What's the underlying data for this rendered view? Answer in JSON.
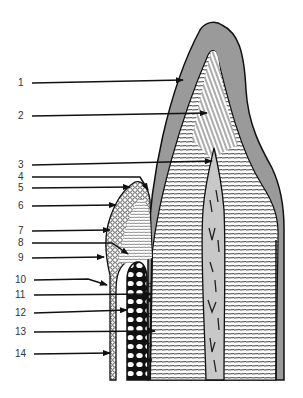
{
  "diagram": {
    "colors": {
      "enamel": "#9a9a9a",
      "pulp": "#c8c8c8",
      "outline": "#111111",
      "background": "#ffffff",
      "label_text": "#333333"
    },
    "labels": [
      {
        "id": "1",
        "text": "1",
        "y": 83,
        "target_x": 183,
        "target_y": 80
      },
      {
        "id": "2",
        "text": "2",
        "y": 116,
        "target_x": 207,
        "target_y": 113
      },
      {
        "id": "3",
        "text": "3",
        "y": 165,
        "target_x": 212,
        "target_y": 161
      },
      {
        "id": "4",
        "text": "4",
        "y": 177,
        "target_x": 148,
        "target_y": 192
      },
      {
        "id": "5",
        "text": "5",
        "y": 188,
        "target_x": 130,
        "target_y": 187
      },
      {
        "id": "6",
        "text": "6",
        "y": 206,
        "target_x": 116,
        "target_y": 205
      },
      {
        "id": "7",
        "text": "7",
        "y": 231,
        "target_x": 110,
        "target_y": 230
      },
      {
        "id": "8",
        "text": "8",
        "y": 243,
        "target_x": 128,
        "target_y": 254
      },
      {
        "id": "9",
        "text": "9",
        "y": 258,
        "target_x": 104,
        "target_y": 257
      },
      {
        "id": "10",
        "text": "10",
        "y": 280,
        "target_x": 107,
        "target_y": 285
      },
      {
        "id": "11",
        "text": "11",
        "y": 295,
        "target_x": 152,
        "target_y": 294
      },
      {
        "id": "12",
        "text": "12",
        "y": 313,
        "target_x": 127,
        "target_y": 310
      },
      {
        "id": "13",
        "text": "13",
        "y": 332,
        "target_x": 155,
        "target_y": 331
      },
      {
        "id": "14",
        "text": "14",
        "y": 354,
        "target_x": 110,
        "target_y": 353
      }
    ]
  }
}
